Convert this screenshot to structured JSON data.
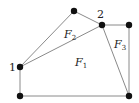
{
  "diagram": {
    "type": "planar-graph",
    "nodes": [
      {
        "id": "top",
        "x": 74,
        "y": 11,
        "label": ""
      },
      {
        "id": "2",
        "x": 102,
        "y": 25,
        "label": "2"
      },
      {
        "id": "top-right",
        "x": 129,
        "y": 25,
        "label": ""
      },
      {
        "id": "1",
        "x": 20,
        "y": 67,
        "label": "1"
      },
      {
        "id": "bottom-left",
        "x": 20,
        "y": 96,
        "label": ""
      },
      {
        "id": "bottom-right",
        "x": 129,
        "y": 96,
        "label": ""
      }
    ],
    "edges": [
      [
        "1",
        "top"
      ],
      [
        "top",
        "2"
      ],
      [
        "1",
        "2"
      ],
      [
        "2",
        "top-right"
      ],
      [
        "top-right",
        "bottom-right"
      ],
      [
        "2",
        "bottom-right"
      ],
      [
        "1",
        "bottom-left"
      ],
      [
        "bottom-left",
        "bottom-right"
      ]
    ],
    "faces": [
      {
        "main": "F",
        "sub": "1"
      },
      {
        "main": "F",
        "sub": "2"
      },
      {
        "main": "F",
        "sub": "3"
      }
    ],
    "node_labels": {
      "n1": "1",
      "n2": "2"
    }
  }
}
